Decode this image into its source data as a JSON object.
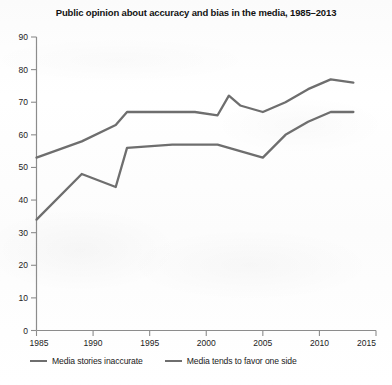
{
  "chart_data": {
    "type": "line",
    "title": "Public opinion about accuracy and bias in the media, 1985–2013",
    "xlabel": "",
    "ylabel": "",
    "xlim": [
      1985,
      2015
    ],
    "ylim": [
      0,
      90
    ],
    "xticks": [
      1985,
      1990,
      1995,
      2000,
      2005,
      2010,
      2015
    ],
    "xtick_labels": [
      "1985",
      "1990",
      "1995",
      "2000",
      "2005",
      "2010",
      "2015"
    ],
    "yticks": [
      0,
      10,
      20,
      30,
      40,
      50,
      60,
      70,
      80,
      90
    ],
    "ytick_labels": [
      "0",
      "10",
      "20",
      "30",
      "40",
      "50",
      "60",
      "70",
      "80",
      "90"
    ],
    "grid": false,
    "legend_position": "bottom-left",
    "line_color": "#6e6e6e",
    "series": [
      {
        "name": "Media stories inaccurate",
        "color": "#6e6e6e",
        "x": [
          1985,
          1989,
          1992,
          1993,
          1997,
          1999,
          2001,
          2002,
          2003,
          2005,
          2007,
          2009,
          2011,
          2013
        ],
        "values": [
          53,
          58,
          63,
          67,
          67,
          67,
          66,
          72,
          69,
          67,
          70,
          74,
          77,
          76
        ]
      },
      {
        "name": "Media tends to favor one side",
        "color": "#6e6e6e",
        "x": [
          1985,
          1989,
          1992,
          1993,
          1997,
          1999,
          2001,
          2002,
          2003,
          2005,
          2007,
          2009,
          2011,
          2013
        ],
        "values": [
          34,
          48,
          44,
          56,
          57,
          57,
          57,
          56,
          55,
          53,
          60,
          64,
          67,
          67
        ]
      }
    ]
  },
  "legend": {
    "items": [
      {
        "label": "Media stories inaccurate"
      },
      {
        "label": "Media tends to favor one side"
      }
    ]
  }
}
